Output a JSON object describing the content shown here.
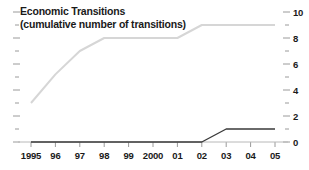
{
  "chart_data": {
    "type": "line",
    "title": "Economic Transitions",
    "subtitle": "(cumulative number of transitions)",
    "xlabel": "",
    "ylabel": "",
    "x": [
      "1995",
      "96",
      "97",
      "98",
      "99",
      "2000",
      "01",
      "02",
      "03",
      "04",
      "05"
    ],
    "xtick_labels": [
      "1995",
      "96",
      "97",
      "98",
      "99",
      "2000",
      "01",
      "02",
      "03",
      "04",
      "05"
    ],
    "ytick_labels": [
      "0",
      "2",
      "4",
      "6",
      "8",
      "10"
    ],
    "ytick_values": [
      0,
      2,
      4,
      6,
      8,
      10
    ],
    "yminor_values": [
      1,
      3,
      5,
      7,
      9
    ],
    "ylim": [
      0,
      10
    ],
    "grid": false,
    "legend": "none",
    "y_axis_position": "right",
    "series": [
      {
        "name": "cumulative transitions (upper)",
        "color": "#d6d6d6",
        "values": [
          3,
          5.2,
          7,
          8,
          8,
          8,
          8,
          9,
          9,
          9,
          9
        ]
      },
      {
        "name": "cumulative transitions (lower)",
        "color": "#3a3a3a",
        "values": [
          0,
          0,
          0,
          0,
          0,
          0,
          0,
          0,
          1,
          1,
          1
        ]
      }
    ]
  },
  "axis": {
    "baseline_color": "#b8b8b8",
    "tick_color": "#9a9a9a"
  }
}
